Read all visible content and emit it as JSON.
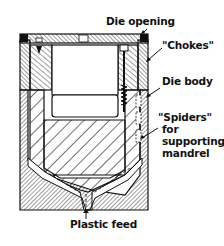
{
  "diagram": {
    "labels": {
      "die_opening": "Die opening",
      "chokes": "\"Chokes\"",
      "die_body": "Die body",
      "spiders_line1": "\"Spiders\"",
      "spiders_line2": "for",
      "spiders_line3": "supporting",
      "spiders_line4": "mandrel",
      "plastic_feed": "Plastic feed"
    },
    "colors": {
      "ink": "#111111",
      "background": "#ffffff"
    }
  }
}
